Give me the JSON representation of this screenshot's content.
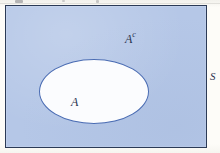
{
  "figure": {
    "kind": "venn-diagram",
    "width": 220,
    "height": 153
  },
  "labels": {
    "complement_base": "A",
    "complement_superscript": "c",
    "set_a": "A",
    "universal_set": "S"
  },
  "colors": {
    "page_background": "#fdfcf8",
    "universe_fill": "#b5c7e7",
    "universe_border": "#2b3a56",
    "set_fill": "#fbfcfe",
    "set_border": "#4a6cb3",
    "label_ink": "#2a3350"
  },
  "geometry": {
    "universe_rect": {
      "x": 5,
      "y": 5,
      "width": 202,
      "height": 143
    },
    "set_a_ellipse": {
      "cx": 93,
      "cy": 90,
      "rx": 55,
      "ry": 32
    },
    "label_a_complement": {
      "x": 119,
      "y": 26
    },
    "label_a": {
      "x": 65,
      "y": 90
    },
    "label_s": {
      "x": 210,
      "y": 71
    }
  }
}
